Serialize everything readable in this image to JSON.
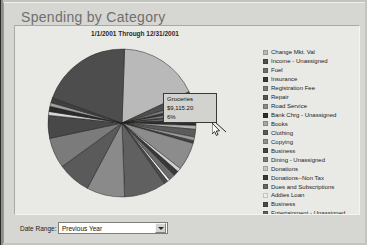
{
  "window": {
    "title": "Spending by Category"
  },
  "report": {
    "subtitle": "1/1/2001 Through 12/31/2001"
  },
  "tooltip": {
    "category": "Groceries",
    "amount": "$9,115.20",
    "percent": "6%"
  },
  "controls": {
    "date_range_label": "Date Range:",
    "date_range_value": "Previous Year"
  },
  "chart_data": {
    "type": "pie",
    "title": "Spending by Category",
    "subtitle": "1/1/2001 Through 12/31/2001",
    "legend_position": "right",
    "highlighted": {
      "label": "Groceries",
      "value": 9115.2,
      "percent": 6
    },
    "categories": [
      "Change Mkt. Val",
      "Income - Unassigned",
      "Fuel",
      "Insurance",
      "Registration Fee",
      "Repair",
      "Road Service",
      "Bank Chrg - Unassigned",
      "Books",
      "Clothing",
      "Copying",
      "Business",
      "Dining - Unassigned",
      "Donations",
      "Donations--Non Tax",
      "Dues and Subscriptions",
      "Addies Loan",
      "Business",
      "Entertainment - Unassigned"
    ],
    "values": [
      17.5,
      2.2,
      1.0,
      0.7,
      0.6,
      0.5,
      0.5,
      3.0,
      0.5,
      1.6,
      0.6,
      0.5,
      13.5,
      0.6,
      1.1,
      1.4,
      0.5,
      0.6,
      9.0
    ],
    "colors": [
      "#b9b9b9",
      "#4f4f4f",
      "#6e6e6e",
      "#3a3a3a",
      "#7c7c7c",
      "#555555",
      "#8a8a8a",
      "#2e2e2e",
      "#a5a5a5",
      "#5c5c5c",
      "#909090",
      "#454545",
      "#7a7a7a",
      "#c6c6c6",
      "#383838",
      "#666666",
      "#ededed",
      "#4a4a4a",
      "#5f5f5f"
    ],
    "slices": [
      {
        "label": "Change Mkt. Val",
        "start": 272,
        "sweep": 63,
        "color": "#b9b9b9"
      },
      {
        "label": "Income - Unassigned",
        "start": 335,
        "sweep": 8,
        "color": "#4f4f4f"
      },
      {
        "label": "Fuel",
        "start": 343,
        "sweep": 4,
        "color": "#7d7d7d"
      },
      {
        "label": "Insurance",
        "start": 347,
        "sweep": 3,
        "color": "#3a3a3a"
      },
      {
        "label": "Registration Fee",
        "start": 350,
        "sweep": 3,
        "color": "#8f8f8f"
      },
      {
        "label": "Repair",
        "start": 353,
        "sweep": 2,
        "color": "#4a4a4a"
      },
      {
        "label": "Road Service",
        "start": 355,
        "sweep": 2,
        "color": "#a0a0a0"
      },
      {
        "label": "Bank Chrg - Unassigned",
        "start": 357,
        "sweep": 5,
        "color": "#2e2e2e"
      },
      {
        "label": "Books",
        "start": 2,
        "sweep": 3,
        "color": "#b0b0b0"
      },
      {
        "label": "Clothing",
        "start": 5,
        "sweep": 6,
        "color": "#5c5c5c"
      },
      {
        "label": "Copying",
        "start": 11,
        "sweep": 3,
        "color": "#9a9a9a"
      },
      {
        "label": "Business",
        "start": 14,
        "sweep": 2,
        "color": "#454545"
      },
      {
        "label": "Groceries",
        "start": 16,
        "sweep": 22,
        "color": "#8c8c8c"
      },
      {
        "label": "Donations",
        "start": 38,
        "sweep": 3,
        "color": "#cfcfcf"
      },
      {
        "label": "Donations--Non Tax",
        "start": 41,
        "sweep": 4,
        "color": "#383838"
      },
      {
        "label": "Dues and Subscriptions",
        "start": 45,
        "sweep": 5,
        "color": "#6b6b6b"
      },
      {
        "label": "Addies Loan",
        "start": 50,
        "sweep": 2,
        "color": "#ededed"
      },
      {
        "label": "Business",
        "start": 52,
        "sweep": 3,
        "color": "#4a4a4a"
      },
      {
        "label": "Entertainment - Unassigned",
        "start": 55,
        "sweep": 33,
        "color": "#606060"
      },
      {
        "label": "Other A",
        "start": 88,
        "sweep": 30,
        "color": "#8a8a8a"
      },
      {
        "label": "Other B",
        "start": 118,
        "sweep": 26,
        "color": "#5a5a5a"
      },
      {
        "label": "Other C",
        "start": 144,
        "sweep": 24,
        "color": "#7b7b7b"
      },
      {
        "label": "Other D",
        "start": 168,
        "sweep": 18,
        "color": "#484848"
      },
      {
        "label": "Other E",
        "start": 186,
        "sweep": 3,
        "color": "#d6d6d6"
      },
      {
        "label": "Other F",
        "start": 189,
        "sweep": 4,
        "color": "#2b2b2b"
      },
      {
        "label": "Other G",
        "start": 193,
        "sweep": 3,
        "color": "#9e9e9e"
      },
      {
        "label": "Other H",
        "start": 196,
        "sweep": 4,
        "color": "#3f3f3f"
      },
      {
        "label": "Other I",
        "start": 200,
        "sweep": 72,
        "color": "#4d4d4d"
      }
    ]
  },
  "legend": {
    "items": [
      {
        "label": "Change Mkt. Val",
        "color": "#b9b9b9"
      },
      {
        "label": "Income - Unassigned",
        "color": "#4f4f4f"
      },
      {
        "label": "Fuel",
        "color": "#6e6e6e"
      },
      {
        "label": "Insurance",
        "color": "#3a3a3a"
      },
      {
        "label": "Registration Fee",
        "color": "#7c7c7c"
      },
      {
        "label": "Repair",
        "color": "#555555"
      },
      {
        "label": "Road Service",
        "color": "#8a8a8a"
      },
      {
        "label": "Bank Chrg - Unassigned",
        "color": "#2e2e2e"
      },
      {
        "label": "Books",
        "color": "#a5a5a5"
      },
      {
        "label": "Clothing",
        "color": "#5c5c5c"
      },
      {
        "label": "Copying",
        "color": "#909090"
      },
      {
        "label": "Business",
        "color": "#454545"
      },
      {
        "label": "Dining - Unassigned",
        "color": "#7a7a7a"
      },
      {
        "label": "Donations",
        "color": "#c6c6c6"
      },
      {
        "label": "Donations--Non Tax",
        "color": "#383838"
      },
      {
        "label": "Dues and Subscriptions",
        "color": "#666666"
      },
      {
        "label": "Addies Loan",
        "color": "#ededed"
      },
      {
        "label": "Business",
        "color": "#4a4a4a"
      },
      {
        "label": "Entertainment - Unassigned",
        "color": "#5f5f5f"
      }
    ]
  }
}
